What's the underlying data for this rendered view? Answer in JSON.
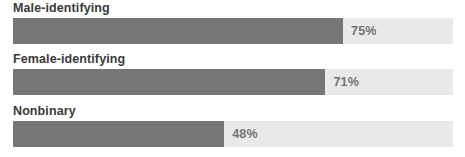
{
  "chart_data": {
    "type": "bar",
    "orientation": "horizontal",
    "title": "",
    "subtitle": "",
    "xlabel": "",
    "ylabel": "",
    "xlim": [
      0,
      100
    ],
    "grid": false,
    "legend": null,
    "value_suffix": "%",
    "categories": [
      "Male-identifying",
      "Female-identifying",
      "Nonbinary"
    ],
    "values": [
      75,
      71,
      48
    ],
    "value_labels": [
      "75%",
      "71%",
      "48%"
    ],
    "colors": {
      "bar_fill": "#767676",
      "bar_track": "#e9e9e9",
      "label_text": "#3a3a3a",
      "value_text": "#737373",
      "background": "#ffffff"
    },
    "rows": [
      {
        "label": "Male-identifying",
        "value": 75,
        "value_label": "75%"
      },
      {
        "label": "Female-identifying",
        "value": 71,
        "value_label": "71%"
      },
      {
        "label": "Nonbinary",
        "value": 48,
        "value_label": "48%"
      }
    ]
  }
}
